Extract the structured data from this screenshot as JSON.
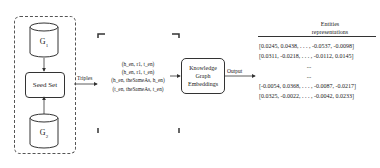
{
  "diagram": {
    "source_graphs": [
      {
        "label": "G",
        "subscript": "1"
      },
      {
        "label": "G",
        "subscript": "2"
      }
    ],
    "seed_set": "Seed Set",
    "edge_labels": {
      "triples": "Triples",
      "output": "Output"
    },
    "triples": [
      "(h_en, r1, t_en)",
      "(h_en, r1, t_en)",
      "(h_en, theSameAs, h_en)",
      "(t_en, theSameAs, t_en)"
    ],
    "kge_box": {
      "line1": "Knowledge",
      "line2": "Graph",
      "line3": "Embeddings"
    },
    "entities": {
      "title_line1": "Entities",
      "title_line2": "representations",
      "vectors": [
        "[0.0245, 0.0438, . . . ,   -0.0537, -0.0098]",
        "[0.0311, -0.0218, . . . ,   -0.0112, 0.0145]",
        "...",
        "...",
        "[-0.0054, 0.0368, . . . , -0.0087, -0.0217]",
        "[0.0325, -0.0022, . . . ,   -0.0042, 0.0233]"
      ]
    },
    "colors": {
      "stroke": "#333333",
      "background": "#ffffff"
    }
  }
}
